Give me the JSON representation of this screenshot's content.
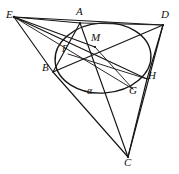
{
  "figure": {
    "kind": "euclidean-geometry-diagram",
    "width": 179,
    "height": 174,
    "background_color": "#ffffff",
    "ink_color": "#171514"
  },
  "points": [
    {
      "id": "E",
      "label": "E",
      "x": 14,
      "y": 17,
      "label_x": 7,
      "label_y": 10
    },
    {
      "id": "A",
      "label": "A",
      "x": 80,
      "y": 23,
      "label_x": 76,
      "label_y": 8
    },
    {
      "id": "D",
      "label": "D",
      "x": 163,
      "y": 25,
      "label_x": 162,
      "label_y": 11
    },
    {
      "id": "M",
      "label": "M",
      "x": 95,
      "y": 47,
      "label_x": 93,
      "label_y": 33
    },
    {
      "id": "F",
      "label": "F",
      "x": 68,
      "y": 54,
      "label_x": 62,
      "label_y": 45
    },
    {
      "id": "B",
      "label": "B",
      "x": 53,
      "y": 72,
      "label_x": 44,
      "label_y": 63
    },
    {
      "id": "H",
      "label": "H",
      "x": 147,
      "y": 79,
      "label_x": 149,
      "label_y": 70
    },
    {
      "id": "G",
      "label": "G",
      "x": 133,
      "y": 89,
      "label_x": 131,
      "label_y": 85
    },
    {
      "id": "C",
      "label": "C",
      "x": 128,
      "y": 157,
      "label_x": 125,
      "label_y": 158
    }
  ],
  "angle_marks": [
    {
      "id": "alpha",
      "label": "α",
      "x": 89,
      "y": 87
    }
  ],
  "circle": {
    "center_x": 103,
    "center_y": 58,
    "radius_x": 48,
    "radius_y": 35,
    "rotation_deg": -4
  },
  "segments": [
    {
      "id": "E-A",
      "from": "E",
      "to": "A"
    },
    {
      "id": "E-D",
      "from": "E",
      "to": "D"
    },
    {
      "id": "E-H",
      "from": "E",
      "to": "H"
    },
    {
      "id": "E-G",
      "from": "E",
      "to": "G"
    },
    {
      "id": "E-B",
      "from": "E",
      "to": "B"
    },
    {
      "id": "E-C",
      "from": "E",
      "to": "C"
    },
    {
      "id": "A-B",
      "from": "A",
      "to": "B"
    },
    {
      "id": "A-C",
      "from": "A",
      "to": "C"
    },
    {
      "id": "A-D",
      "from": "A",
      "to": "D"
    },
    {
      "id": "B-D",
      "from": "B",
      "to": "D"
    },
    {
      "id": "B-C",
      "from": "B",
      "to": "C"
    },
    {
      "id": "D-H",
      "from": "D",
      "to": "H"
    },
    {
      "id": "D-C",
      "from": "D",
      "to": "C"
    },
    {
      "id": "H-C",
      "from": "H",
      "to": "C"
    },
    {
      "id": "M-G",
      "from": "M",
      "to": "G"
    },
    {
      "id": "F-H",
      "from": "F",
      "to": "H"
    }
  ]
}
